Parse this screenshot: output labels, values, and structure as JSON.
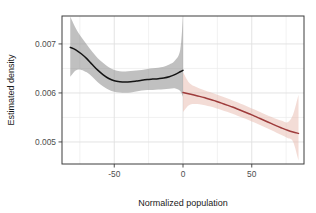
{
  "chart_data": {
    "type": "line",
    "title": "",
    "subtitle": "",
    "xlabel": "Normalized population",
    "ylabel": "Estimated density",
    "xlim": [
      -88,
      88
    ],
    "ylim": [
      0.00455,
      0.00757
    ],
    "xticks": [
      -50,
      0,
      50
    ],
    "xtick_labels": [
      "-50",
      "0",
      "50"
    ],
    "yticks": [
      0.005,
      0.006,
      0.007
    ],
    "ytick_labels": [
      "0.005",
      "0.006",
      "0.007"
    ],
    "grid": true,
    "grid_x_minor": [
      -75,
      -25,
      25,
      75
    ],
    "grid_y_minor": [
      0.0055,
      0.0065
    ],
    "legend": "none",
    "cutoff": 0,
    "series": [
      {
        "name": "left",
        "color": "#141414",
        "ribbon_color": "#8c8c8c",
        "ribbon_opacity": 0.55,
        "x": [
          -82,
          -78,
          -74,
          -70,
          -66,
          -62,
          -58,
          -54,
          -50,
          -46,
          -42,
          -38,
          -34,
          -30,
          -26,
          -22,
          -18,
          -14,
          -10,
          -6,
          -2,
          0
        ],
        "y": [
          0.00693,
          0.00688,
          0.0068,
          0.0067,
          0.00658,
          0.006465,
          0.00637,
          0.006295,
          0.006248,
          0.006228,
          0.006222,
          0.006228,
          0.006242,
          0.006258,
          0.006272,
          0.006282,
          0.006292,
          0.006305,
          0.00633,
          0.006375,
          0.006432,
          0.00646
        ],
        "ylow": [
          0.00633,
          0.00646,
          0.00647,
          0.00642,
          0.00633,
          0.00622,
          0.00613,
          0.006065,
          0.006025,
          0.006008,
          0.006002,
          0.00601,
          0.00603,
          0.006048,
          0.006058,
          0.006062,
          0.006068,
          0.006075,
          0.006085,
          0.006095,
          0.00604,
          0.00592
        ],
        "yhigh": [
          0.00756,
          0.00732,
          0.00714,
          0.00699,
          0.00684,
          0.00671,
          0.00661,
          0.006525,
          0.00647,
          0.006445,
          0.00644,
          0.006446,
          0.006458,
          0.00647,
          0.006488,
          0.006502,
          0.006515,
          0.006535,
          0.00658,
          0.006655,
          0.00688,
          0.00757
        ]
      },
      {
        "name": "right",
        "color": "#9e3b3b",
        "ribbon_color": "#e8b9ad",
        "ribbon_opacity": 0.5,
        "x": [
          0,
          4,
          8,
          12,
          16,
          20,
          24,
          28,
          32,
          36,
          40,
          44,
          48,
          52,
          56,
          60,
          64,
          68,
          72,
          76,
          80,
          84
        ],
        "y": [
          0.00601,
          0.005985,
          0.005958,
          0.00593,
          0.0059,
          0.005868,
          0.00583,
          0.005792,
          0.005752,
          0.005712,
          0.005668,
          0.005622,
          0.005575,
          0.005528,
          0.005478,
          0.005428,
          0.005378,
          0.005328,
          0.005282,
          0.005238,
          0.005202,
          0.005175
        ],
        "ylow": [
          0.00561,
          0.005745,
          0.005775,
          0.00577,
          0.00575,
          0.005722,
          0.005688,
          0.005652,
          0.005615,
          0.005575,
          0.005532,
          0.005488,
          0.005442,
          0.005395,
          0.005345,
          0.005295,
          0.005242,
          0.005188,
          0.005135,
          0.005082,
          0.00501,
          0.00462
        ],
        "yhigh": [
          0.00642,
          0.006225,
          0.00614,
          0.00609,
          0.00605,
          0.006012,
          0.005972,
          0.005932,
          0.00589,
          0.005848,
          0.005805,
          0.005758,
          0.00571,
          0.005662,
          0.005612,
          0.005562,
          0.005515,
          0.00547,
          0.005432,
          0.0054,
          0.005555,
          0.005965
        ]
      }
    ]
  },
  "panel": {
    "background": "#ffffff",
    "border_color": "#3d3d3d",
    "grid_color": "#ebebeb"
  }
}
